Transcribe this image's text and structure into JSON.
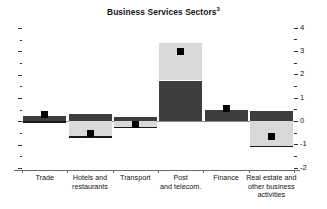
{
  "chart_data": {
    "type": "bar",
    "title": "Business Services Sectors",
    "title_superscript": "3",
    "xlabel": "",
    "ylabel": "",
    "ylim": [
      -2,
      4
    ],
    "ytick_labels": [
      "4",
      "3",
      "2",
      "1",
      "0",
      "-1",
      "-2"
    ],
    "ytick_values": [
      4,
      3,
      2,
      1,
      0,
      -1,
      -2
    ],
    "minor_tick_step": 0.5,
    "grid": false,
    "legend": "none",
    "stacked": true,
    "categories": [
      "Trade",
      "Hotels and restaurants",
      "Transport",
      "Post and telecom.",
      "Finance",
      "Real estate and other business activities"
    ],
    "category_lines": [
      [
        "Trade"
      ],
      [
        "Hotels and",
        "restaurants"
      ],
      [
        "Transport"
      ],
      [
        "Post",
        "and telecom."
      ],
      [
        "Finance"
      ],
      [
        "Real estate and",
        "other business",
        "activities"
      ]
    ],
    "series": [
      {
        "name": "dark-segment",
        "color": "#3d3d3d",
        "values": [
          0.25,
          0.3,
          0.2,
          1.75,
          0.5,
          0.45
        ]
      },
      {
        "name": "light-segment",
        "color": "#d9d9d9",
        "values": [
          -0.05,
          -0.7,
          -0.3,
          1.6,
          0.0,
          -1.1
        ]
      }
    ],
    "totals": [
      0.25,
      -0.4,
      -0.1,
      3.35,
      0.5,
      -0.65
    ],
    "markers": {
      "name": "total-marker",
      "color": "#000000",
      "values": [
        0.3,
        -0.5,
        -0.15,
        3.0,
        0.55,
        -0.65
      ]
    }
  },
  "axis": {
    "right_labels": [
      "4",
      "3",
      "2",
      "1",
      "0",
      "-1",
      "-2"
    ]
  }
}
